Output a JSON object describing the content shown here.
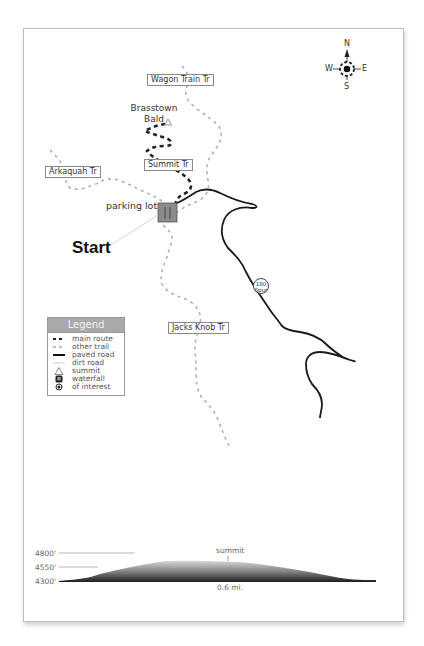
{
  "map": {
    "compass": {
      "north": "N",
      "south": "S",
      "east": "E",
      "west": "W"
    },
    "peak": {
      "name_line1": "Brasstown",
      "name_line2": "Bald",
      "icon": "summit-triangle-icon"
    },
    "trail_labels": {
      "wagon_train": "Wagon Train Tr",
      "summit": "Summit Tr",
      "arkaquah": "Arkaquah Tr",
      "jacks_knob": "Jacks Knob Tr"
    },
    "parking_label": "parking lot",
    "start_label": "Start",
    "road_shield": {
      "line1": "180",
      "line2": "Spur"
    },
    "colors": {
      "main_route": "#222222",
      "other_trail": "#b0b0b0",
      "paved_road": "#1a1a1a",
      "parking_fill": "#8c8c8c",
      "legend_header": "#a9a9a9"
    }
  },
  "legend": {
    "title": "Legend",
    "items": [
      {
        "label": "main route",
        "symbol": "dashed-dark-line"
      },
      {
        "label": "other trail",
        "symbol": "dashed-light-line"
      },
      {
        "label": "paved road",
        "symbol": "solid-dark-line"
      },
      {
        "label": "dirt road",
        "symbol": "thin-light-line"
      },
      {
        "label": "summit",
        "symbol": "triangle"
      },
      {
        "label": "waterfall",
        "symbol": "rounded-square"
      },
      {
        "label": "of interest",
        "symbol": "target-dot"
      }
    ]
  },
  "elevation_profile": {
    "y_labels": [
      "4800'",
      "4550'",
      "4300'"
    ],
    "summit_label": "summit",
    "distance_label": "0.6 mi."
  }
}
